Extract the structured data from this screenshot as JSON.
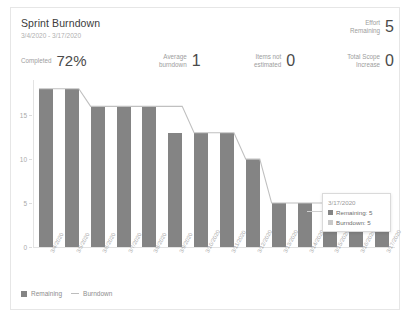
{
  "header": {
    "title": "Sprint Burndown",
    "date_range": "3/4/2020 - 3/17/2020",
    "metrics": [
      {
        "name": "completed",
        "label_line1": "Completed",
        "label_line2": "",
        "value": "72%"
      },
      {
        "name": "average-burndown",
        "label_line1": "Average",
        "label_line2": "burndown",
        "value": "1"
      },
      {
        "name": "items-not-estimated",
        "label_line1": "Items not",
        "label_line2": "estimated",
        "value": "0"
      },
      {
        "name": "effort-remaining",
        "label_line1": "Effort",
        "label_line2": "Remaining",
        "value": "5"
      },
      {
        "name": "total-scope-increase",
        "label_line1": "Total Scope",
        "label_line2": "Increase",
        "value": "0"
      }
    ]
  },
  "tooltip": {
    "date": "3/17/2020",
    "rows": [
      {
        "label": "Remaining: 5",
        "color": "#848484"
      },
      {
        "label": "Burndown: 5",
        "color": "#c9c9c9"
      }
    ]
  },
  "legend": [
    {
      "label": "Remaining",
      "marker": "square",
      "color": "#848484"
    },
    {
      "label": "Burndown",
      "marker": "line",
      "color": "#bdbdbd"
    }
  ],
  "colors": {
    "bar": "#848484",
    "line": "#c0c0c0",
    "axis": "#e3e3e3",
    "tick_text": "#aaaaaa"
  },
  "chart_data": {
    "type": "bar",
    "title": "Sprint Burndown",
    "xlabel": "",
    "ylabel": "",
    "ylim": [
      0,
      19
    ],
    "yticks": [
      0,
      5,
      10,
      15
    ],
    "grid": false,
    "legend_position": "bottom-left",
    "categories": [
      "3/4/2020",
      "3/5/2020",
      "3/6/2020",
      "3/7/2020",
      "3/8/2020",
      "3/9/2020",
      "3/10/2020",
      "3/11/2020",
      "3/12/2020",
      "3/13/2020",
      "3/14/2020",
      "3/15/2020",
      "3/16/2020",
      "3/17/2020"
    ],
    "series": [
      {
        "name": "Remaining",
        "type": "bar",
        "color": "#848484",
        "values": [
          18,
          18,
          16,
          16,
          16,
          13,
          13,
          13,
          10,
          5,
          5,
          5,
          5,
          5
        ]
      },
      {
        "name": "Burndown",
        "type": "line",
        "color": "#c0c0c0",
        "values": [
          18,
          18,
          16,
          16,
          16,
          16,
          13,
          13,
          10,
          5,
          5,
          5,
          5,
          5
        ]
      }
    ]
  }
}
